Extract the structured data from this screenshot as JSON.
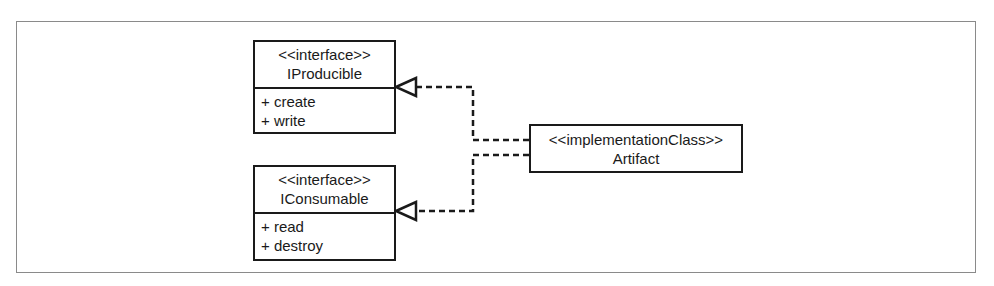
{
  "diagram": {
    "type": "UML class diagram",
    "interfaces": [
      {
        "stereotype": "<<interface>>",
        "name": "IProducible",
        "operations": [
          "+ create",
          "+ write"
        ]
      },
      {
        "stereotype": "<<interface>>",
        "name": "IConsumable",
        "operations": [
          "+ read",
          "+ destroy"
        ]
      }
    ],
    "implementation": {
      "stereotype": "<<implementationClass>>",
      "name": "Artifact"
    },
    "relationships": [
      {
        "from": "Artifact",
        "to": "IProducible",
        "kind": "realization"
      },
      {
        "from": "Artifact",
        "to": "IConsumable",
        "kind": "realization"
      }
    ]
  }
}
